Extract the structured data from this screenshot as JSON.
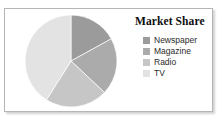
{
  "card": {
    "background": "#ffffff",
    "border_color": "#b5b5b5"
  },
  "title": "Market Share",
  "legend": {
    "items": [
      {
        "label": "Newspaper",
        "color": "#9b9b9b",
        "swatch_name": "legend-swatch-newspaper"
      },
      {
        "label": "Magazine",
        "color": "#ababab",
        "swatch_name": "legend-swatch-magazine"
      },
      {
        "label": "Radio",
        "color": "#c6c6c6",
        "swatch_name": "legend-swatch-radio"
      },
      {
        "label": "TV",
        "color": "#e3e3e3",
        "swatch_name": "legend-swatch-tv"
      }
    ]
  },
  "chart_data": {
    "type": "pie",
    "title": "Market Share",
    "categories": [
      "Newspaper",
      "Magazine",
      "Radio",
      "TV"
    ],
    "values": [
      17,
      20,
      22,
      41
    ],
    "unit": "percent",
    "colors": [
      "#9b9b9b",
      "#ababab",
      "#c6c6c6",
      "#e3e3e3"
    ],
    "start_angle_deg": 0,
    "direction": "clockwise",
    "legend_position": "right",
    "grid": false,
    "xlabel": "",
    "ylabel": ""
  }
}
